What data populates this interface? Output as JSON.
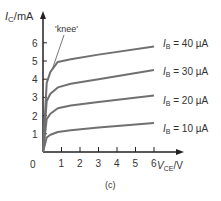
{
  "chart_data": {
    "type": "line",
    "title": "",
    "xlabel": "V_CE / V",
    "ylabel": "I_C / mA",
    "xlim": [
      0,
      7
    ],
    "ylim": [
      0,
      7
    ],
    "x_ticks": [
      1,
      2,
      3,
      4,
      5,
      6
    ],
    "y_ticks": [
      1,
      2,
      3,
      4,
      5,
      6
    ],
    "origin_label": "0",
    "grid": false,
    "annotation": "'knee'",
    "caption": "(c)",
    "series": [
      {
        "name": "I_B = 10 µA",
        "x": [
          0,
          0.2,
          0.4,
          0.8,
          1.5,
          3,
          6
        ],
        "y": [
          0,
          0.8,
          0.95,
          1.1,
          1.2,
          1.35,
          1.6
        ]
      },
      {
        "name": "I_B = 20 µA",
        "x": [
          0,
          0.2,
          0.4,
          0.8,
          1.5,
          3,
          6
        ],
        "y": [
          0,
          1.8,
          2.1,
          2.4,
          2.55,
          2.75,
          3.1
        ]
      },
      {
        "name": "I_B = 30 µA",
        "x": [
          0,
          0.2,
          0.4,
          0.8,
          1.5,
          3,
          6
        ],
        "y": [
          0,
          2.8,
          3.2,
          3.55,
          3.75,
          4.0,
          4.5
        ]
      },
      {
        "name": "I_B = 40 µA",
        "x": [
          0,
          0.2,
          0.4,
          0.8,
          1.5,
          3,
          6
        ],
        "y": [
          0,
          3.8,
          4.4,
          4.95,
          5.1,
          5.35,
          5.8
        ]
      }
    ]
  },
  "labels": {
    "y_axis_main": "I",
    "y_axis_sub": "C",
    "y_axis_unit": "/mA",
    "x_axis_main": "V",
    "x_axis_sub": "CE",
    "x_axis_unit": "/V",
    "knee": "'knee'",
    "caption": "(c)",
    "origin": "0",
    "series_labels": [
      {
        "main": "I",
        "sub": "B",
        "value": " = 40 µA"
      },
      {
        "main": "I",
        "sub": "B",
        "value": " = 30 µA"
      },
      {
        "main": "I",
        "sub": "B",
        "value": " = 20 µA"
      },
      {
        "main": "I",
        "sub": "B",
        "value": " = 10 µA"
      }
    ]
  },
  "colors": {
    "axis": "#222222",
    "curve": "#707070",
    "text": "#333333"
  }
}
